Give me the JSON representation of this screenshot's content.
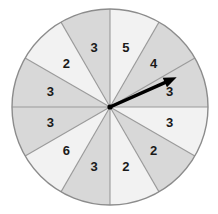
{
  "figure": {
    "name": "spinner-wheel",
    "type": "probability-spinner",
    "background_color": "#ffffff"
  },
  "wheel": {
    "center_x": 110,
    "center_y": 107,
    "radius": 98,
    "sector_count": 12,
    "outline_color": "#8c8c8c",
    "divider_color": "#9a9a9a",
    "shaded_fill": "#d8d8d8",
    "light_fill": "#f2f2f2",
    "start_angle_deg": -90,
    "sectors": [
      {
        "index": 0,
        "label": "5",
        "value": 5,
        "shade": "light",
        "start_deg": -90,
        "end_deg": -60
      },
      {
        "index": 1,
        "label": "4",
        "value": 4,
        "shade": "shaded",
        "start_deg": -60,
        "end_deg": -30
      },
      {
        "index": 2,
        "label": "3",
        "value": 3,
        "shade": "shaded",
        "start_deg": -30,
        "end_deg": 0
      },
      {
        "index": 3,
        "label": "3",
        "value": 3,
        "shade": "light",
        "start_deg": 0,
        "end_deg": 30
      },
      {
        "index": 4,
        "label": "2",
        "value": 2,
        "shade": "shaded",
        "start_deg": 30,
        "end_deg": 60
      },
      {
        "index": 5,
        "label": "2",
        "value": 2,
        "shade": "light",
        "start_deg": 60,
        "end_deg": 90
      },
      {
        "index": 6,
        "label": "3",
        "value": 3,
        "shade": "shaded",
        "start_deg": 90,
        "end_deg": 120
      },
      {
        "index": 7,
        "label": "6",
        "value": 6,
        "shade": "light",
        "start_deg": 120,
        "end_deg": 150
      },
      {
        "index": 8,
        "label": "3",
        "value": 3,
        "shade": "shaded",
        "start_deg": 150,
        "end_deg": 180
      },
      {
        "index": 9,
        "label": "3",
        "value": 3,
        "shade": "shaded",
        "start_deg": 180,
        "end_deg": 210
      },
      {
        "index": 10,
        "label": "2",
        "value": 2,
        "shade": "light",
        "start_deg": 210,
        "end_deg": 240
      },
      {
        "index": 11,
        "label": "3",
        "value": 3,
        "shade": "shaded",
        "start_deg": 240,
        "end_deg": 270
      }
    ]
  },
  "pointer": {
    "label": "spinner-arrow",
    "color": "#000000",
    "angle_deg": -24,
    "length": 73,
    "tip_x": 177,
    "tip_y": 77,
    "pointing_at_value": 3
  },
  "chart_data": {
    "type": "pie",
    "title": "",
    "categories": [
      "5",
      "4",
      "3",
      "3",
      "2",
      "2",
      "3",
      "6",
      "3",
      "3",
      "2",
      "3"
    ],
    "values": [
      30,
      30,
      30,
      30,
      30,
      30,
      30,
      30,
      30,
      30,
      30,
      30
    ],
    "labels": [
      "5",
      "4",
      "3",
      "3",
      "2",
      "2",
      "3",
      "6",
      "3",
      "3",
      "2",
      "3"
    ],
    "equal_sectors": true,
    "legend": "none"
  }
}
